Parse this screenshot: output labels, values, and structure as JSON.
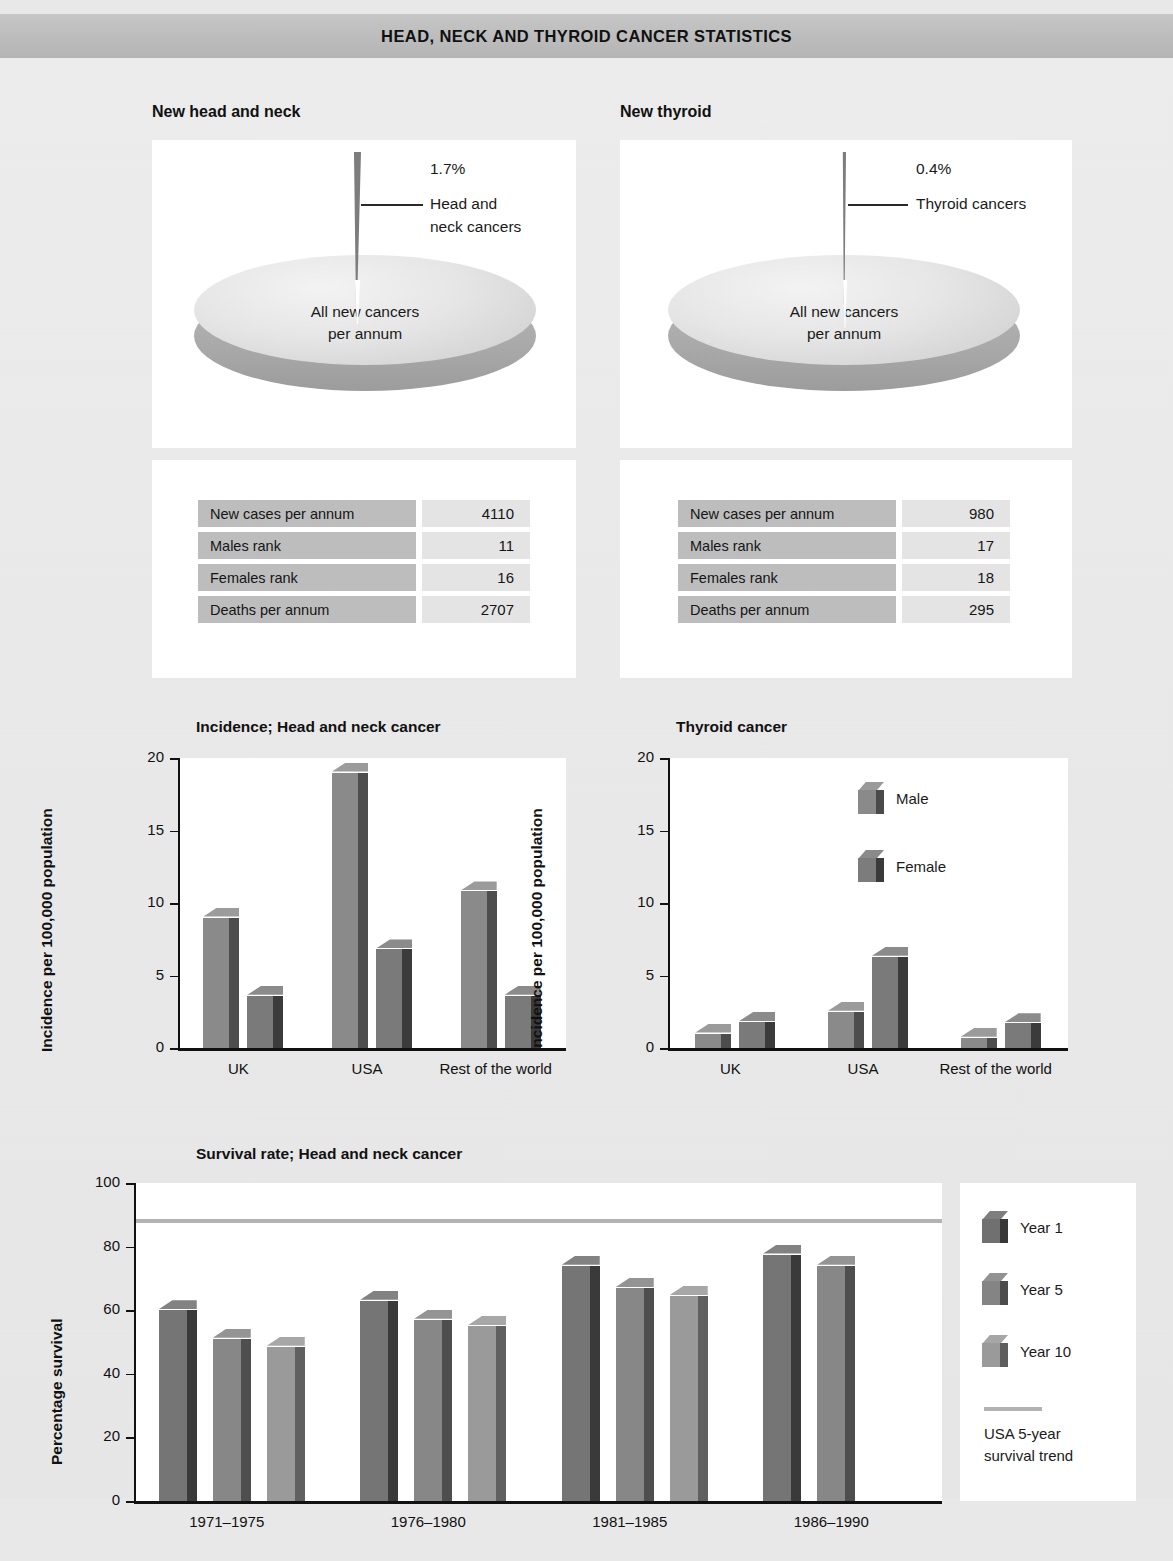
{
  "header": {
    "title": "HEAD, NECK AND THYROID CANCER STATISTICS"
  },
  "pies": [
    {
      "title": "New head and neck",
      "percent": "1.7%",
      "slice_label_line1": "Head and",
      "slice_label_line2": "neck cancers",
      "disc_caption_line1": "All new cancers",
      "disc_caption_line2": "per annum"
    },
    {
      "title": "New thyroid",
      "percent": "0.4%",
      "slice_label_line1": "Thyroid cancers",
      "slice_label_line2": "",
      "disc_caption_line1": "All new cancers",
      "disc_caption_line2": "per annum"
    }
  ],
  "tables": [
    {
      "rows": [
        {
          "key": "New cases per annum",
          "value": "4110"
        },
        {
          "key": "Males rank",
          "value": "11"
        },
        {
          "key": "Females rank",
          "value": "16"
        },
        {
          "key": "Deaths per annum",
          "value": "2707"
        }
      ]
    },
    {
      "rows": [
        {
          "key": "New cases per annum",
          "value": "980"
        },
        {
          "key": "Males rank",
          "value": "17"
        },
        {
          "key": "Females rank",
          "value": "18"
        },
        {
          "key": "Deaths per annum",
          "value": "295"
        }
      ]
    }
  ],
  "legend_incidence": [
    {
      "label": "Male"
    },
    {
      "label": "Female"
    }
  ],
  "legend_survival": {
    "bars": [
      {
        "label": "Year 1"
      },
      {
        "label": "Year 5"
      },
      {
        "label": "Year 10"
      }
    ],
    "line_label_line1": "USA 5-year",
    "line_label_line2": "survival trend"
  },
  "colors": {
    "bar_front": "#8a8a8a",
    "bar_front_dark": "#6e6e6e",
    "bar_front_light": "#a0a0a0",
    "bar_side": "#4a4a4a",
    "bar_side_dark": "#3a3a3a",
    "bar_top": "#6f6f6f",
    "trend": "#b3b3b3",
    "header_band": "#bcbcbc",
    "table_key": "#bdbdbd",
    "table_value": "#e4e4e4",
    "slice": "#7d7d7d"
  },
  "chart_data": [
    {
      "type": "bar",
      "title": "Incidence; Head and neck cancer",
      "xlabel": "",
      "ylabel": "Incidence per 100,000 population",
      "ylim": [
        0,
        20
      ],
      "yticks": [
        0,
        5,
        10,
        15,
        20
      ],
      "grid": false,
      "legend": [
        "Male",
        "Female"
      ],
      "legend_position": "none",
      "categories": [
        "UK",
        "USA",
        "Rest of the world"
      ],
      "series": [
        {
          "name": "Male",
          "values": [
            9.0,
            19.0,
            10.8
          ]
        },
        {
          "name": "Female",
          "values": [
            3.6,
            6.8,
            3.6
          ]
        }
      ]
    },
    {
      "type": "bar",
      "title": "Thyroid cancer",
      "xlabel": "",
      "ylabel": "Incidence per 100,000 population",
      "ylim": [
        0,
        20
      ],
      "yticks": [
        0,
        5,
        10,
        15,
        20
      ],
      "grid": false,
      "legend": [
        "Male",
        "Female"
      ],
      "legend_position": "upper right",
      "categories": [
        "UK",
        "USA",
        "Rest of the world"
      ],
      "series": [
        {
          "name": "Male",
          "values": [
            1.0,
            2.5,
            0.7
          ]
        },
        {
          "name": "Female",
          "values": [
            1.8,
            6.3,
            1.7
          ]
        }
      ]
    },
    {
      "type": "bar",
      "title": "Survival rate; Head and neck cancer",
      "xlabel": "",
      "ylabel": "Percentage survival",
      "ylim": [
        0,
        100
      ],
      "yticks": [
        0,
        20,
        40,
        60,
        80,
        100
      ],
      "grid": false,
      "legend": [
        "Year 1",
        "Year 5",
        "Year 10",
        "USA 5-year survival trend"
      ],
      "legend_position": "right",
      "categories": [
        "1971–1975",
        "1976–1980",
        "1981–1985",
        "1986–1990"
      ],
      "series": [
        {
          "name": "Year 1",
          "values": [
            60,
            63,
            74,
            77.5
          ]
        },
        {
          "name": "Year 5",
          "values": [
            51,
            57,
            67,
            74
          ]
        },
        {
          "name": "Year 10",
          "values": [
            48.5,
            55,
            64.5,
            null
          ]
        }
      ],
      "reference_line": {
        "name": "USA 5-year survival trend",
        "value": 88
      }
    }
  ]
}
